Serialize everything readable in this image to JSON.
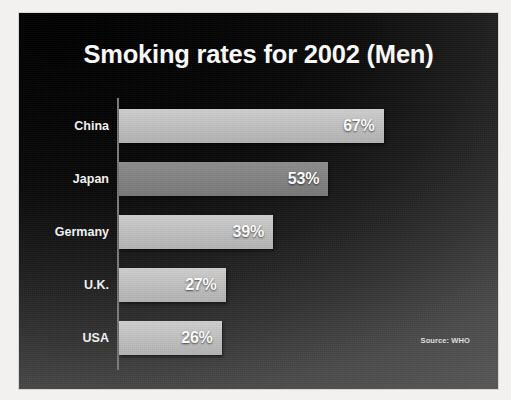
{
  "slide": {
    "title": "Smoking rates for 2002 (Men)",
    "source_note": "Source: WHO",
    "background_color": "#0a0a0a",
    "title_color": "#fdfdfd",
    "bar_color": "#c2c2c2",
    "value_label_color": "#ffffff",
    "axis_color": "#7b7b7b"
  },
  "chart_data": {
    "type": "bar",
    "orientation": "horizontal",
    "title": "Smoking rates for 2002 (Men)",
    "subtitle": "",
    "xlabel": "",
    "ylabel": "",
    "unit": "%",
    "grid": false,
    "legend": "none",
    "xlim": [
      0,
      78
    ],
    "source": "Source: WHO",
    "categories": [
      "China",
      "Japan",
      "Germany",
      "U.K.",
      "USA"
    ],
    "values": [
      67,
      53,
      39,
      27,
      26
    ],
    "value_labels": [
      "67%",
      "53%",
      "39%",
      "27%",
      "26%"
    ],
    "bars": [
      {
        "category": "China",
        "value": 67,
        "label": "67%"
      },
      {
        "category": "Japan",
        "value": 53,
        "label": "53%"
      },
      {
        "category": "Germany",
        "value": 39,
        "label": "39%"
      },
      {
        "category": "U.K.",
        "value": 27,
        "label": "27%"
      },
      {
        "category": "USA",
        "value": 26,
        "label": "26%"
      }
    ]
  }
}
